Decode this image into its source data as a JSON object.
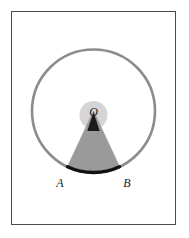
{
  "figure": {
    "kind": "geometry-diagram",
    "caption": "",
    "background_color": "#ffffff",
    "frame": {
      "border_color": "#4a4a4a",
      "fill_color": "#ffffff",
      "x": 11,
      "y": 11,
      "width": 165,
      "height": 214
    },
    "circle": {
      "center_x": 93.5,
      "center_y": 111,
      "radius": 61.5,
      "stroke_color": "#8c8c8c",
      "stroke_width": 2.6,
      "fill": "none"
    },
    "center_glow": {
      "center_x": 93.5,
      "center_y": 115,
      "radius": 14,
      "fill_color": "#d5d5d5"
    },
    "sector": {
      "fill_color": "#9a9a9a",
      "stroke_color": "#9a9a9a",
      "start_angle_deg": 115,
      "end_angle_deg": 65,
      "description": "shaded circular sector O-A-B"
    },
    "angle_marker": {
      "fill_color": "#1a1a1a",
      "size": 13,
      "description": "dark triangular angle marker at vertex O"
    },
    "chord_arc": {
      "stroke_color": "#111111",
      "stroke_width": 3.2,
      "description": "bold arc AB"
    },
    "points": [
      {
        "id": "O",
        "label": "O",
        "label_x": 93.5,
        "label_y": 116,
        "x": 93.5,
        "y": 122
      },
      {
        "id": "A",
        "label": "A",
        "label_x": 60,
        "label_y": 187,
        "x": 67.5,
        "y": 171.5
      },
      {
        "id": "B",
        "label": "B",
        "label_x": 127,
        "label_y": 187,
        "x": 119.5,
        "y": 171.5
      }
    ],
    "label_font_size": 12
  }
}
